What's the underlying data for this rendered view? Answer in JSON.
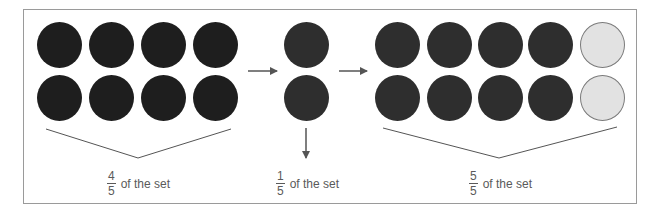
{
  "colors": {
    "dark": "#1e1e1e",
    "mid": "#2e2e2e",
    "light": "#e2e2e2",
    "text": "#5a5a5a",
    "line": "#555555"
  },
  "groups": [
    {
      "name": "whole-set",
      "rows": 2,
      "cols": 4,
      "shaded": 8,
      "label": {
        "numerator": "4",
        "denominator": "5",
        "text": "of the set"
      }
    },
    {
      "name": "unit-fraction",
      "rows": 2,
      "cols": 1,
      "shaded": 2,
      "label": {
        "numerator": "1",
        "denominator": "5",
        "text": "of the set"
      }
    },
    {
      "name": "combined-set",
      "rows": 2,
      "cols": 5,
      "shaded": 8,
      "unshaded": 2,
      "label": {
        "numerator": "5",
        "denominator": "5",
        "text": "of the set"
      }
    }
  ]
}
